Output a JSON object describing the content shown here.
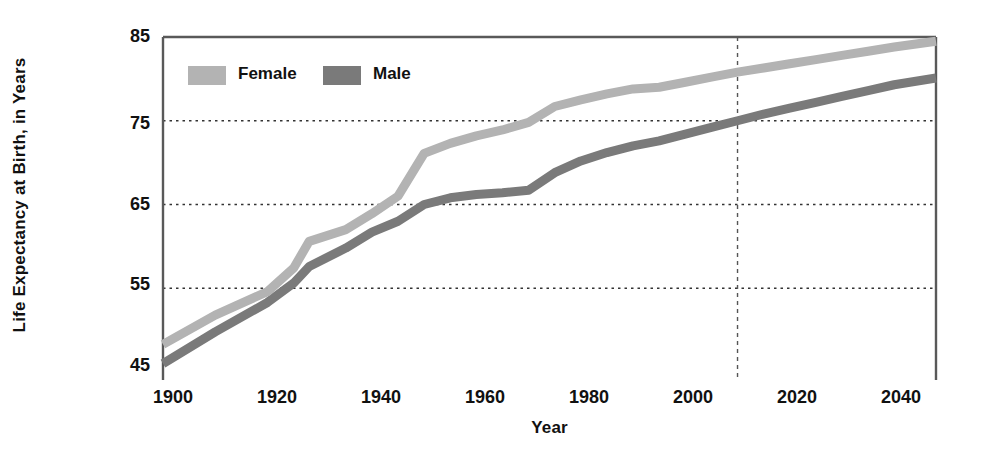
{
  "chart_data": {
    "type": "line",
    "title": "",
    "xlabel": "Year",
    "ylabel": "Life Expectancy at Birth, in Years",
    "xlim": [
      1900,
      2048
    ],
    "ylim": [
      45,
      85
    ],
    "xticks": [
      "1900",
      "1920",
      "1940",
      "1960",
      "1980",
      "2000",
      "2020",
      "2040"
    ],
    "xtick_values": [
      1900,
      1920,
      1940,
      1960,
      1980,
      2000,
      2020,
      2040
    ],
    "yticks": [
      "45",
      "55",
      "65",
      "75",
      "85"
    ],
    "ytick_values": [
      45,
      55,
      65,
      75,
      85
    ],
    "grid": "horizontal-dotted",
    "legend_position": "top-left-inside",
    "projection_divider_year": 2010,
    "x": [
      1900,
      1910,
      1920,
      1925,
      1928,
      1935,
      1940,
      1945,
      1950,
      1955,
      1960,
      1965,
      1970,
      1975,
      1980,
      1985,
      1990,
      1995,
      2000,
      2005,
      2010,
      2015,
      2020,
      2025,
      2030,
      2035,
      2040,
      2048
    ],
    "series": [
      {
        "name": "Female",
        "color": "#b3b3b3",
        "values": [
          48.3,
          51.8,
          54.6,
          57.4,
          60.6,
          62.0,
          63.9,
          66.0,
          71.1,
          72.3,
          73.2,
          73.9,
          74.8,
          76.7,
          77.5,
          78.2,
          78.8,
          79.0,
          79.6,
          80.2,
          80.8,
          81.3,
          81.8,
          82.3,
          82.8,
          83.3,
          83.8,
          84.5
        ]
      },
      {
        "name": "Male",
        "color": "#7a7a7a",
        "values": [
          46.0,
          49.8,
          53.3,
          55.6,
          57.6,
          59.8,
          61.7,
          63.0,
          65.0,
          65.8,
          66.2,
          66.4,
          66.7,
          68.8,
          70.2,
          71.2,
          72.0,
          72.6,
          73.4,
          74.2,
          75.0,
          75.8,
          76.5,
          77.2,
          77.9,
          78.6,
          79.3,
          80.1
        ]
      }
    ],
    "legend": [
      {
        "label": "Female",
        "color": "#b3b3b3"
      },
      {
        "label": "Male",
        "color": "#7a7a7a"
      }
    ]
  },
  "style": {
    "axis_color": "#595959",
    "grid_color": "#333333",
    "divider_color": "#555555",
    "background": "#ffffff",
    "text_color": "#111111"
  }
}
